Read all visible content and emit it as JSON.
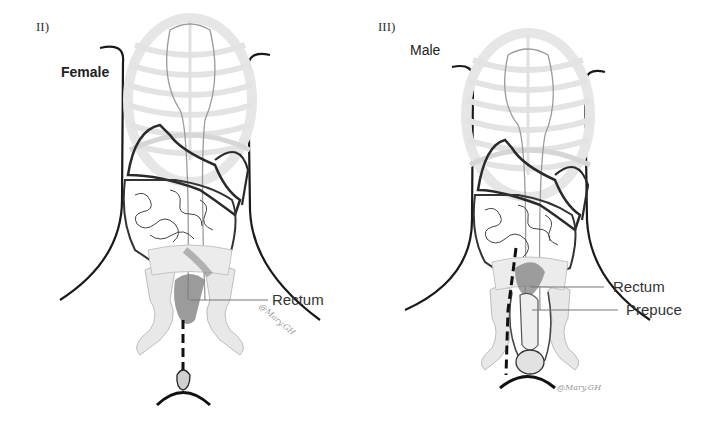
{
  "panels": [
    {
      "id": "II",
      "label": "II)",
      "sex": "Female",
      "callouts": [
        {
          "text": "Rectum"
        }
      ],
      "signature": "@Mary.GH"
    },
    {
      "id": "III",
      "label": "III)",
      "sex": "Male",
      "callouts": [
        {
          "text": "Rectum"
        },
        {
          "text": "Prepuce"
        }
      ],
      "signature": "@Mary.GH"
    }
  ],
  "colors": {
    "outline": "#1a1a1a",
    "bone": "#d9d9d9",
    "organ_line": "#333333",
    "rectum_shade": "#6e6e6e",
    "leader": "#777777"
  }
}
